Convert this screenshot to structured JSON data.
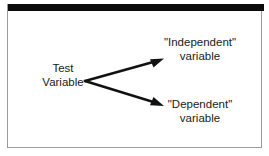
{
  "figure": {
    "type": "diagram",
    "colors": {
      "background": "#ffffff",
      "ink": "#1a1a1a",
      "rule": "#0b0b0b",
      "panel_border": "#9a9a9a"
    }
  },
  "nodes": {
    "source": {
      "line1": "Test",
      "line2": "Variable"
    },
    "branch_top": {
      "line1": "\"Independent\"",
      "line2": "variable"
    },
    "branch_bottom": {
      "line1": "\"Dependent\"",
      "line2": "variable"
    }
  },
  "connectors": [
    {
      "name": "arrow-to-independent",
      "from": [
        85,
        81
      ],
      "to": [
        163,
        59
      ]
    },
    {
      "name": "arrow-to-dependent",
      "from": [
        85,
        81
      ],
      "to": [
        163,
        105
      ]
    }
  ]
}
